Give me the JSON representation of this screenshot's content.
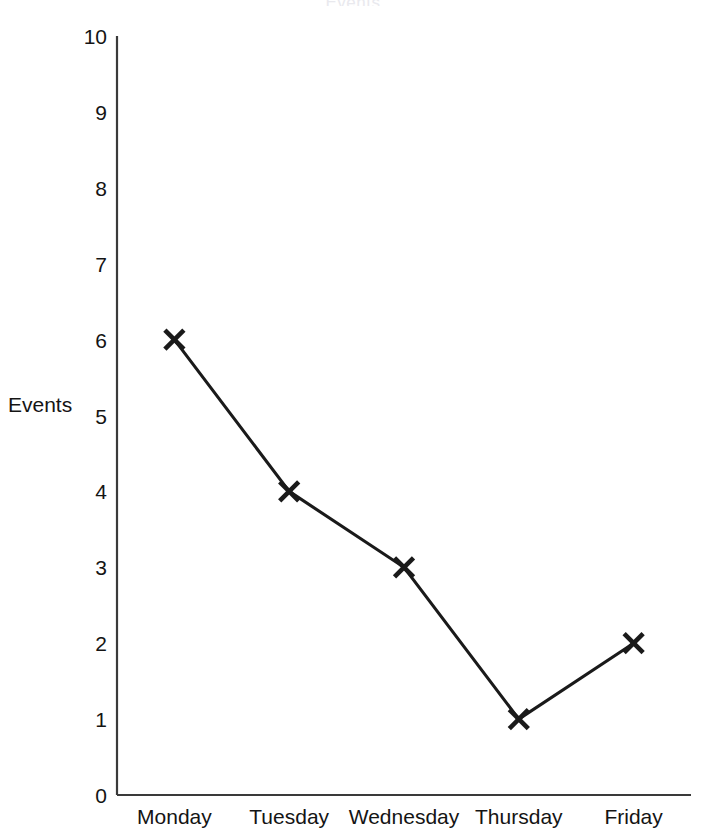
{
  "figure": {
    "background_color": "#ffffff",
    "title_remnant": "Events",
    "axis_color": "#3a3a3a",
    "line_color": "#1a1a1a",
    "marker_color": "#1a1a1a"
  },
  "chart_data": {
    "type": "line",
    "title": "",
    "xlabel": "",
    "ylabel": "Events",
    "categories": [
      "Monday",
      "Tuesday",
      "Wednesday",
      "Thursday",
      "Friday"
    ],
    "values": [
      6,
      4,
      3,
      1,
      2
    ],
    "series": [
      {
        "name": "Events",
        "values": [
          6,
          4,
          3,
          1,
          2
        ],
        "marker": "x",
        "line_color": "#1a1a1a",
        "marker_color": "#1a1a1a"
      }
    ],
    "ylim": [
      0,
      10
    ],
    "yticks": [
      0,
      1,
      2,
      3,
      4,
      5,
      6,
      7,
      8,
      9,
      10
    ],
    "ytick_labels": [
      "0",
      "1",
      "2",
      "3",
      "4",
      "5",
      "6",
      "7",
      "8",
      "9",
      "10"
    ],
    "xtick_labels": [
      "Monday",
      "Tuesday",
      "Wednesday",
      "Thursday",
      "Friday"
    ],
    "grid": false,
    "legend": false,
    "legend_position": "none",
    "annotations": []
  }
}
